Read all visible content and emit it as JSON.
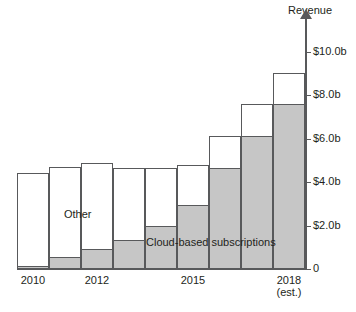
{
  "chart_data": {
    "type": "bar",
    "stacked": true,
    "title": "",
    "xlabel": "",
    "ylabel": "Revenue",
    "ylim": [
      0,
      11.0
    ],
    "grid": false,
    "legend_position": "inline-annotations",
    "categories": [
      "2010",
      "2011",
      "2012",
      "2013",
      "2014",
      "2015",
      "2016",
      "2017",
      "2018"
    ],
    "x_tick_labels": [
      {
        "category": "2010",
        "text": "2010",
        "sub": ""
      },
      {
        "category": "2012",
        "text": "2012",
        "sub": ""
      },
      {
        "category": "2015",
        "text": "2015",
        "sub": ""
      },
      {
        "category": "2018",
        "text": "2018",
        "sub": "(est.)"
      }
    ],
    "y_ticks": [
      {
        "value": 0,
        "label": "0"
      },
      {
        "value": 2.0,
        "label": "$2.0b"
      },
      {
        "value": 4.0,
        "label": "$4.0b"
      },
      {
        "value": 6.0,
        "label": "$6.0b"
      },
      {
        "value": 8.0,
        "label": "$8.0b"
      },
      {
        "value": 10.0,
        "label": "$10.0b"
      }
    ],
    "units": "billions of US dollars",
    "series": [
      {
        "name": "Cloud-based subscriptions",
        "color": "#c6c6c6",
        "values": [
          0.15,
          0.55,
          0.9,
          1.35,
          2.0,
          2.95,
          4.65,
          6.1,
          7.6
        ]
      },
      {
        "name": "Other",
        "color": "#ffffff",
        "values": [
          4.25,
          4.15,
          4.0,
          3.3,
          2.65,
          1.85,
          1.45,
          1.5,
          1.4
        ]
      }
    ],
    "totals": [
      4.4,
      4.7,
      4.9,
      4.65,
      4.65,
      4.8,
      6.1,
      7.6,
      9.0
    ],
    "annotations": [
      {
        "text": "Other",
        "series": "Other"
      },
      {
        "text": "Cloud-based subscriptions",
        "series": "Cloud-based subscriptions"
      }
    ]
  },
  "axis": {
    "y_title": "Revenue"
  }
}
